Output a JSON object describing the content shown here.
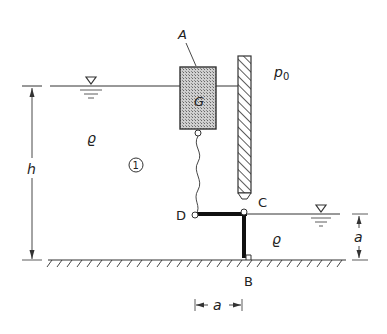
{
  "diagram": {
    "labels": {
      "body_A": "A",
      "weight_G": "G",
      "pressure_p0": "p",
      "pressure_sub": "0",
      "density_left": "ϱ",
      "density_right": "ϱ",
      "region": "1",
      "height_h": "h",
      "dim_a_right": "a",
      "dim_a_bottom": "a",
      "point_B": "B",
      "point_C": "C",
      "point_D": "D"
    },
    "icons": [
      "water-surface-triangle-icon",
      "hatched-wall-icon",
      "hatched-ground-icon",
      "hinge-icon"
    ]
  }
}
